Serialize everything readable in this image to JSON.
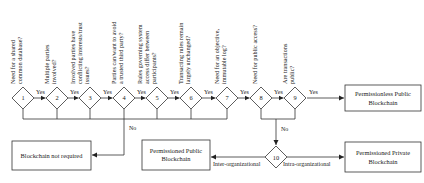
{
  "diagram": {
    "questions": [
      {
        "num": "1",
        "lines": [
          "Need for a shared",
          "common database?"
        ]
      },
      {
        "num": "2",
        "lines": [
          "Multiple parties",
          "involved?"
        ]
      },
      {
        "num": "3",
        "lines": [
          "Involved parties have",
          "conflicting interests/trust",
          "issues?"
        ]
      },
      {
        "num": "4",
        "lines": [
          "Parties can/want to avoid",
          "a trusted third party?"
        ]
      },
      {
        "num": "5",
        "lines": [
          "Rules governing system",
          "access differ between",
          "participants?"
        ]
      },
      {
        "num": "6",
        "lines": [
          "Transacting rules remain",
          "largely unchanged?"
        ]
      },
      {
        "num": "7",
        "lines": [
          "Need for an objective,",
          "immutable log?"
        ]
      },
      {
        "num": "8",
        "lines": [
          "Need for public access?"
        ]
      },
      {
        "num": "9",
        "lines": [
          "Are transactions",
          "public?"
        ]
      }
    ],
    "decision10": {
      "num": "10"
    },
    "yes_label": "Yes",
    "no_label": "No",
    "inter_label": "Inter-organizational",
    "intra_label": "Intra-organizational",
    "outcomes": {
      "permissionless_public": [
        "Permissionless Public",
        "Blockchain"
      ],
      "not_required": [
        "Blockchain not required"
      ],
      "permissioned_public": [
        "Permissioned Public",
        "Blockchain"
      ],
      "permissioned_private": [
        "Permissioned Private",
        "Blockchain"
      ]
    }
  }
}
